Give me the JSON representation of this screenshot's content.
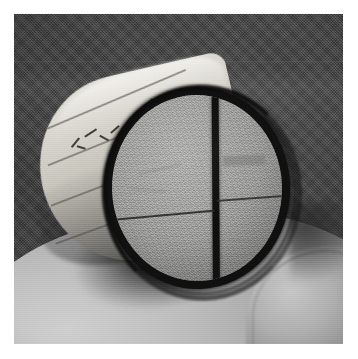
{
  "image": {
    "kind": "photograph",
    "subject": "cylindrical core specimen held in a hand",
    "caption": "Grayscale photograph of a short cylindrical specimen resting on a hand, its flat circular end face marked with a bold inked circle outline and a cross of two diameter lines.",
    "orientation": "landscape-square",
    "color_mode": "grayscale",
    "width_px": 358,
    "height_px": 359,
    "border": {
      "present": true,
      "color": "#ffffff",
      "thickness_px": 14
    }
  },
  "scene": {
    "background": {
      "label": "dark woven cloth backdrop",
      "color": "#3c3c3c",
      "highlight_color": "#4a4a4a",
      "texture": "fine diagonal weave",
      "seam_line": {
        "label": "horizontal seam in backdrop",
        "y_px": 61,
        "color": "#6e6e6e"
      }
    },
    "hand": {
      "label": "hand supporting specimen",
      "color": "#b6b6b6",
      "highlight_color": "#d0d0d0",
      "shadow_color": "#787878",
      "region": "lower third of frame"
    },
    "cast_shadow": {
      "label": "shadow cast by specimen onto hand",
      "color": "#141414"
    }
  },
  "specimen": {
    "label": "cylindrical core specimen",
    "barrel": {
      "label": "curved cylindrical side surface",
      "color": "#cfccc4",
      "highlight_color": "#e6e4df",
      "shadow_color": "#7d7a76",
      "rotation_deg": -13,
      "banding_lines": [
        {
          "label": "banding-line-1",
          "left_px": 18,
          "top_px": 36,
          "length_px": 150,
          "angle_deg": -10
        },
        {
          "label": "banding-line-2",
          "left_px": 10,
          "top_px": 72,
          "length_px": 168,
          "angle_deg": -9
        },
        {
          "label": "banding-line-3",
          "left_px": 4,
          "top_px": 112,
          "length_px": 176,
          "angle_deg": -8
        },
        {
          "label": "banding-line-4",
          "left_px": 0,
          "top_px": 150,
          "length_px": 170,
          "angle_deg": -7
        }
      ],
      "handwriting": {
        "label": "illegible pencil handwriting on barrel",
        "legible": false,
        "color": "#3e3a36",
        "strokes": [
          {
            "left_px": 36,
            "top_px": 56,
            "width_px": 12,
            "height_px": 2,
            "angle_deg": -38
          },
          {
            "left_px": 42,
            "top_px": 62,
            "width_px": 9,
            "height_px": 2,
            "angle_deg": 30
          },
          {
            "left_px": 52,
            "top_px": 50,
            "width_px": 14,
            "height_px": 2,
            "angle_deg": -20
          },
          {
            "left_px": 66,
            "top_px": 58,
            "width_px": 10,
            "height_px": 2,
            "angle_deg": 42
          },
          {
            "left_px": 78,
            "top_px": 52,
            "width_px": 11,
            "height_px": 2,
            "angle_deg": -28
          },
          {
            "left_px": 90,
            "top_px": 60,
            "width_px": 8,
            "height_px": 2,
            "angle_deg": 35
          },
          {
            "left_px": 100,
            "top_px": 48,
            "width_px": 13,
            "height_px": 2,
            "angle_deg": -24
          },
          {
            "left_px": 118,
            "top_px": 34,
            "width_px": 10,
            "height_px": 2,
            "angle_deg": -40
          },
          {
            "left_px": 126,
            "top_px": 40,
            "width_px": 9,
            "height_px": 2,
            "angle_deg": 28
          }
        ]
      }
    },
    "end_face": {
      "label": "flat circular end face",
      "shape": "circle",
      "color": "#9e9e9c",
      "texture": "fine granular / porous",
      "center_x_px": 197,
      "center_y_px": 180,
      "diameter_px": 186,
      "rim": {
        "label": "inked circle outline on end face",
        "color": "#0d0d0d",
        "thickness_px": 8
      },
      "marks": [
        {
          "label": "vertical diameter mark",
          "color": "#0c0c0c",
          "thickness_px": 7,
          "style": "bold ink",
          "orientation": "vertical"
        },
        {
          "label": "horizontal diameter mark left segment",
          "color": "#222222",
          "thickness_px": 2,
          "style": "thin pencil",
          "orientation": "horizontal"
        },
        {
          "label": "horizontal diameter mark right segment",
          "color": "#262626",
          "thickness_px": 2,
          "style": "thin pencil",
          "orientation": "horizontal"
        }
      ],
      "quadrants": [
        "upper-left",
        "upper-right",
        "lower-left",
        "lower-right"
      ],
      "surface_blemishes": [
        {
          "label": "smudge-upper-right",
          "left_px": 112,
          "top_px": 62,
          "width_px": 42,
          "height_px": 10
        },
        {
          "label": "hairline-upper-left",
          "left_px": 26,
          "top_px": 72,
          "width_px": 44,
          "height_px": 2,
          "angle_deg": -12
        },
        {
          "label": "hairline-mid-left",
          "left_px": 18,
          "top_px": 92,
          "width_px": 36,
          "height_px": 2,
          "angle_deg": 6
        },
        {
          "label": "hairline-lower-right",
          "left_px": 116,
          "top_px": 148,
          "width_px": 40,
          "height_px": 2,
          "angle_deg": 9
        }
      ]
    }
  }
}
